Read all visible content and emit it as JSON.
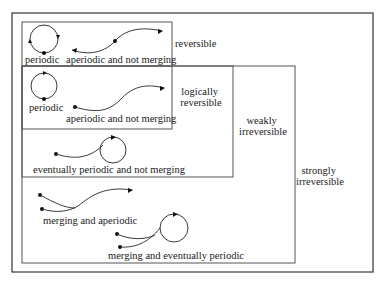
{
  "diagram": {
    "regions": {
      "reversible": "reversible",
      "logically_reversible": [
        "logically",
        "reversible"
      ],
      "weakly_irreversible": [
        "weakly",
        "irreversible"
      ],
      "strongly_irreversible": [
        "strongly",
        "irreversible"
      ]
    },
    "items": {
      "periodic_1": "periodic",
      "aperiodic_1": "aperiodic and not merging",
      "periodic_2": "periodic",
      "aperiodic_2": "aperiodic and not merging",
      "eventually_periodic": "eventually periodic and not merging",
      "merging_aperiodic": "merging and aperiodic",
      "merging_eventually_periodic": "merging and eventually periodic"
    },
    "colors": {
      "line": "#555555",
      "text": "#1a1a1a",
      "background": "#ffffff"
    }
  }
}
